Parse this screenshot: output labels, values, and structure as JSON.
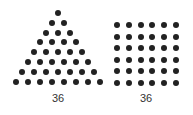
{
  "figures": [
    {
      "name": "triangular-number",
      "shape": "triangle",
      "rows": 8,
      "dot_count": 36,
      "label": "36",
      "apex": {
        "x": 58,
        "y": 13
      },
      "dx": 12,
      "dy": 9.8,
      "label_pos": {
        "x": 58,
        "y": 92
      }
    },
    {
      "name": "square-number",
      "shape": "square",
      "rows": 6,
      "cols": 6,
      "dot_count": 36,
      "label": "36",
      "origin": {
        "x": 117,
        "y": 25
      },
      "dx": 11.8,
      "dy": 11.6,
      "label_pos": {
        "x": 146,
        "y": 92
      }
    }
  ],
  "colors": {
    "dot": "#222222",
    "label": "#333333",
    "background": "#ffffff"
  }
}
